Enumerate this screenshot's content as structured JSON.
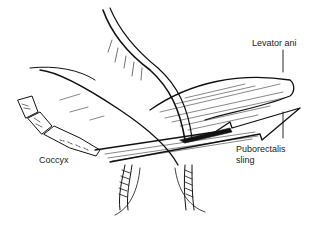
{
  "figure": {
    "type": "anatomical line drawing",
    "ink_color": "#111111",
    "background_color": "#ffffff"
  },
  "labels": {
    "levator_ani": "Levator ani",
    "coccyx": "Coccyx",
    "puborectalis_line1": "Puborectalis",
    "puborectalis_line2": "sling"
  }
}
